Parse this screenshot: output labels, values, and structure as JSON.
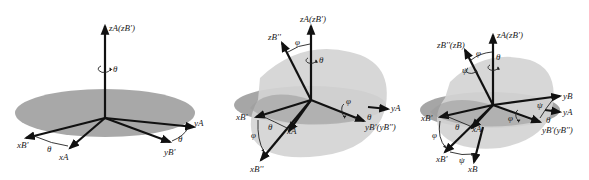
{
  "figure": {
    "colors": {
      "plane_dark": "#a6a6a6",
      "plane_mid": "#b4b4b4",
      "plane_light": "#d6d6d6",
      "axis": "#111111",
      "background": "#ffffff"
    },
    "panels": [
      {
        "id": "panel-1",
        "labels": {
          "z_axis": "zA(zB')",
          "rot_theta": "θ",
          "x_b1": "xB'",
          "x_a": "xA",
          "angle_theta_x": "θ",
          "y_a": "yA",
          "angle_theta_y": "θ",
          "y_b1": "yB'"
        }
      },
      {
        "id": "panel-2",
        "labels": {
          "z_axis": "zA(zB')",
          "z_b2": "zB''",
          "angle_phi_z": "φ",
          "rot_theta": "θ",
          "rot_phi": "φ",
          "y_a": "yA",
          "angle_theta_y": "θ",
          "y_b1": "yB'(yB'')",
          "x_b1": "xB'",
          "angle_theta_x": "θ",
          "x_a": "xA",
          "angle_phi_x": "φ",
          "x_b2": "xB''"
        }
      },
      {
        "id": "panel-3",
        "labels": {
          "z_axis": "zA(zB')",
          "z_b2": "zB''(zB)",
          "angle_phi_z": "φ",
          "rot_theta": "θ",
          "rot_psi": "ψ",
          "y_b": "yB",
          "angle_psi_y": "ψ",
          "y_a": "yA",
          "angle_theta_y": "θ",
          "y_b1": "yB'(yB'')",
          "rot_phi": "φ",
          "x_b1": "xB'",
          "angle_theta_x": "θ",
          "x_a": "xA",
          "angle_phi_x": "φ",
          "x_b2": "xB'",
          "angle_psi_x": "ψ",
          "x_b": "xB"
        }
      }
    ]
  }
}
